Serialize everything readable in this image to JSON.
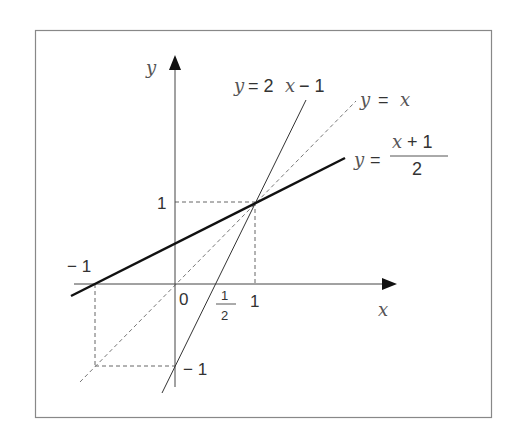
{
  "diagram": {
    "axes": {
      "x_label": "x",
      "y_label": "y",
      "origin_label": "0"
    },
    "ticks": {
      "x_one": "1",
      "x_minus_one": "− 1",
      "y_one": "1",
      "y_minus_one": "− 1",
      "half_num": "1",
      "half_den": "2"
    },
    "lines": [
      {
        "name": "y = 2x − 1",
        "style": "thin solid"
      },
      {
        "name": "y = x",
        "style": "dashed"
      },
      {
        "name": "y = (x + 1)/2",
        "style": "thick solid"
      }
    ],
    "labels": {
      "line1_y": "y",
      "line1_eq": "= 2",
      "line1_x": "x",
      "line1_rest": "− 1",
      "line2_y": "y",
      "line2_eq": "=",
      "line2_x": "x",
      "line3_y": "y",
      "line3_eq": "=",
      "line3_num_x": "x",
      "line3_num_rest": "+ 1",
      "line3_den": "2"
    }
  }
}
